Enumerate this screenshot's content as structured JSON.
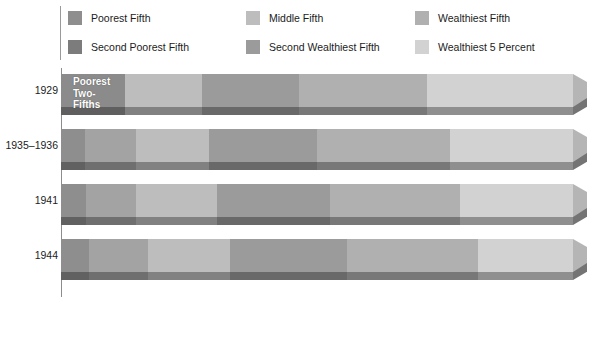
{
  "chart_data": {
    "type": "bar",
    "subtype": "stacked-horizontal-3d",
    "title": "",
    "xlabel": "Percentage",
    "ylabel": "",
    "xlim": [
      0,
      100
    ],
    "xticks": [
      0,
      10,
      20,
      30,
      40,
      50,
      60,
      70,
      80,
      90,
      100
    ],
    "xticklabels": [
      "",
      "10",
      "20",
      "30",
      "40",
      "50",
      "60",
      "70",
      "80",
      "90",
      "100"
    ],
    "grid": false,
    "legend_position": "top",
    "categories": [
      "1929",
      "1935–1936",
      "1941",
      "1944"
    ],
    "series": [
      {
        "name": "Poorest Fifth",
        "color": "#8e8e8e",
        "values": [
          0.0,
          4.1,
          4.1,
          5.4
        ]
      },
      {
        "name": "Second Poorest Fifth",
        "color": "#7c7c7c",
        "values": [
          12.5,
          9.2,
          9.5,
          10.8
        ]
      },
      {
        "name": "Middle Fifth",
        "color": "#bdbdbd",
        "values": [
          13.8,
          14.1,
          15.3,
          16.2
        ]
      },
      {
        "name": "Second Wealthiest Fifth",
        "color": "#9b9b9b",
        "values": [
          19.3,
          20.9,
          22.3,
          22.2
        ]
      },
      {
        "name": "Wealthiest Fifth",
        "color": "#b0b0b0",
        "values": [
          54.4,
          51.7,
          48.8,
          45.4
        ]
      }
    ],
    "highlight_series": {
      "name": "Wealthiest 5 Percent",
      "color": "#d2d2d2",
      "note": "nested at the right end of the Wealthiest Fifth band",
      "values": [
        30.0,
        26.5,
        24.0,
        21.0
      ]
    },
    "annotations": [
      {
        "text": "Poorest\nTwo-Fifths",
        "category": "1929",
        "color": "#ffffff"
      }
    ]
  },
  "legend": {
    "columns": [
      [
        {
          "label": "Poorest Fifth",
          "color": "#8e8e8e",
          "swatch_name": "legend-swatch-poorest-fifth"
        },
        {
          "label": "Second Poorest Fifth",
          "color": "#7c7c7c",
          "swatch_name": "legend-swatch-second-poorest-fifth"
        }
      ],
      [
        {
          "label": "Middle Fifth",
          "color": "#bdbdbd",
          "swatch_name": "legend-swatch-middle-fifth"
        },
        {
          "label": "Second Wealthiest Fifth",
          "color": "#9b9b9b",
          "swatch_name": "legend-swatch-second-wealthiest-fifth"
        }
      ],
      [
        {
          "label": "Wealthiest Fifth",
          "color": "#b0b0b0",
          "swatch_name": "legend-swatch-wealthiest-fifth"
        },
        {
          "label": "Wealthiest 5 Percent",
          "color": "#d2d2d2",
          "swatch_name": "legend-swatch-wealthiest-5-percent"
        }
      ]
    ]
  },
  "axis": {
    "x_title": "Percentage",
    "tick_labels": [
      "10",
      "20",
      "30",
      "40",
      "50",
      "60",
      "70",
      "80",
      "90",
      "100"
    ],
    "tick_values": [
      10,
      20,
      30,
      40,
      50,
      60,
      70,
      80,
      90,
      100
    ]
  },
  "bars": [
    {
      "year": "1929",
      "annotation": "Poorest\nTwo-Fifths",
      "segments": [
        {
          "name": "Poorest Fifth",
          "start": 0.0,
          "end": 0.0,
          "color": "#8e8e8e"
        },
        {
          "name": "Second Poorest Fifth",
          "start": 0.0,
          "end": 12.5,
          "color": "#8b8b8b"
        },
        {
          "name": "Middle Fifth",
          "start": 12.5,
          "end": 27.5,
          "color": "#bdbdbd"
        },
        {
          "name": "Second Wealthiest Fifth",
          "start": 27.5,
          "end": 46.5,
          "color": "#9b9b9b"
        },
        {
          "name": "Wealthiest Fifth",
          "start": 46.5,
          "end": 71.5,
          "color": "#b0b0b0"
        },
        {
          "name": "Wealthiest 5 Percent",
          "start": 71.5,
          "end": 100.0,
          "color": "#d2d2d2"
        }
      ]
    },
    {
      "year": "1935–1936",
      "annotation": "",
      "segments": [
        {
          "name": "Poorest Fifth",
          "start": 0.0,
          "end": 4.7,
          "color": "#8e8e8e"
        },
        {
          "name": "Second Poorest Fifth",
          "start": 4.7,
          "end": 14.7,
          "color": "#a3a3a3"
        },
        {
          "name": "Middle Fifth",
          "start": 14.7,
          "end": 29.0,
          "color": "#bdbdbd"
        },
        {
          "name": "Second Wealthiest Fifth",
          "start": 29.0,
          "end": 50.0,
          "color": "#9b9b9b"
        },
        {
          "name": "Wealthiest Fifth",
          "start": 50.0,
          "end": 76.0,
          "color": "#b0b0b0"
        },
        {
          "name": "Wealthiest 5 Percent",
          "start": 76.0,
          "end": 100.0,
          "color": "#d2d2d2"
        }
      ]
    },
    {
      "year": "1941",
      "annotation": "",
      "segments": [
        {
          "name": "Poorest Fifth",
          "start": 0.0,
          "end": 4.9,
          "color": "#8e8e8e"
        },
        {
          "name": "Second Poorest Fifth",
          "start": 4.9,
          "end": 14.7,
          "color": "#a3a3a3"
        },
        {
          "name": "Middle Fifth",
          "start": 14.7,
          "end": 30.4,
          "color": "#bdbdbd"
        },
        {
          "name": "Second Wealthiest Fifth",
          "start": 30.4,
          "end": 52.5,
          "color": "#9b9b9b"
        },
        {
          "name": "Wealthiest Fifth",
          "start": 52.5,
          "end": 78.0,
          "color": "#b0b0b0"
        },
        {
          "name": "Wealthiest 5 Percent",
          "start": 78.0,
          "end": 100.0,
          "color": "#d2d2d2"
        }
      ]
    },
    {
      "year": "1944",
      "annotation": "",
      "segments": [
        {
          "name": "Poorest Fifth",
          "start": 0.0,
          "end": 5.5,
          "color": "#8e8e8e"
        },
        {
          "name": "Second Poorest Fifth",
          "start": 5.5,
          "end": 17.0,
          "color": "#a3a3a3"
        },
        {
          "name": "Middle Fifth",
          "start": 17.0,
          "end": 33.0,
          "color": "#bdbdbd"
        },
        {
          "name": "Second Wealthiest Fifth",
          "start": 33.0,
          "end": 55.8,
          "color": "#9b9b9b"
        },
        {
          "name": "Wealthiest Fifth",
          "start": 55.8,
          "end": 81.5,
          "color": "#b0b0b0"
        },
        {
          "name": "Wealthiest 5 Percent",
          "start": 81.5,
          "end": 100.0,
          "color": "#d2d2d2"
        }
      ]
    }
  ]
}
